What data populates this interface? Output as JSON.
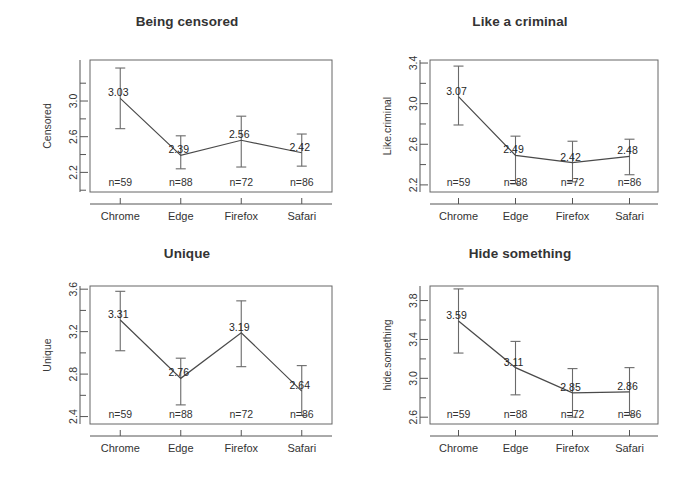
{
  "figure": {
    "background": "#ffffff",
    "line_color": "#4a4a4a",
    "errorbar_color": "#6a6a6a",
    "box_color": "#666666",
    "text_color": "#333333"
  },
  "chart_data": [
    {
      "type": "line",
      "title": "Being censored",
      "xlabel": "",
      "ylabel": "Censored",
      "categories": [
        "Chrome",
        "Edge",
        "Firefox",
        "Safari"
      ],
      "values": [
        3.03,
        2.39,
        2.56,
        2.42
      ],
      "value_labels": [
        "3.03",
        "2.39",
        "2.56",
        "2.42"
      ],
      "error_low": [
        2.69,
        2.24,
        2.26,
        2.27
      ],
      "error_high": [
        3.37,
        2.61,
        2.83,
        2.63
      ],
      "n_labels": [
        "n=59",
        "n=88",
        "n=72",
        "n=86"
      ],
      "n_values": [
        59,
        88,
        72,
        86
      ],
      "yticks": [
        2.2,
        2.6,
        3.0
      ],
      "ytick_labels": [
        "2.2",
        "2.6",
        "3.0"
      ],
      "yminor": [
        2.0,
        2.4,
        2.8,
        3.2
      ],
      "ylim": [
        1.98,
        3.46
      ],
      "grid": false,
      "legend": "none"
    },
    {
      "type": "line",
      "title": "Like a criminal",
      "xlabel": "",
      "ylabel": "Like.criminal",
      "categories": [
        "Chrome",
        "Edge",
        "Firefox",
        "Safari"
      ],
      "values": [
        3.07,
        2.49,
        2.42,
        2.48
      ],
      "value_labels": [
        "3.07",
        "2.49",
        "2.42",
        "2.48"
      ],
      "error_low": [
        2.79,
        2.21,
        2.23,
        2.3
      ],
      "error_high": [
        3.37,
        2.68,
        2.63,
        2.65
      ],
      "n_labels": [
        "n=59",
        "n=88",
        "n=72",
        "n=86"
      ],
      "n_values": [
        59,
        88,
        72,
        86
      ],
      "yticks": [
        2.2,
        2.6,
        3.0,
        3.4
      ],
      "ytick_labels": [
        "2.2",
        "2.6",
        "3.0",
        "3.4"
      ],
      "yminor": [
        2.4,
        2.8,
        3.2
      ],
      "ylim": [
        2.13,
        3.43
      ],
      "grid": false,
      "legend": "none"
    },
    {
      "type": "line",
      "title": "Unique",
      "xlabel": "",
      "ylabel": "Unique",
      "categories": [
        "Chrome",
        "Edge",
        "Firefox",
        "Safari"
      ],
      "values": [
        3.31,
        2.76,
        3.19,
        2.64
      ],
      "value_labels": [
        "3.31",
        "2.76",
        "3.19",
        "2.64"
      ],
      "error_low": [
        3.02,
        2.51,
        2.87,
        2.41
      ],
      "error_high": [
        3.58,
        2.95,
        3.49,
        2.88
      ],
      "n_labels": [
        "n=59",
        "n=88",
        "n=72",
        "n=86"
      ],
      "n_values": [
        59,
        88,
        72,
        86
      ],
      "yticks": [
        2.4,
        2.8,
        3.2,
        3.6
      ],
      "ytick_labels": [
        "2.4",
        "2.8",
        "3.2",
        "3.6"
      ],
      "yminor": [
        2.6,
        3.0,
        3.4
      ],
      "ylim": [
        2.33,
        3.63
      ],
      "grid": false,
      "legend": "none"
    },
    {
      "type": "line",
      "title": "Hide something",
      "xlabel": "",
      "ylabel": "hide.something",
      "categories": [
        "Chrome",
        "Edge",
        "Firefox",
        "Safari"
      ],
      "values": [
        3.59,
        3.11,
        2.85,
        2.86
      ],
      "value_labels": [
        "3.59",
        "3.11",
        "2.85",
        "2.86"
      ],
      "error_low": [
        3.26,
        2.83,
        2.6,
        2.62
      ],
      "error_high": [
        3.92,
        3.38,
        3.1,
        3.11
      ],
      "n_labels": [
        "n=59",
        "n=88",
        "n=72",
        "n=86"
      ],
      "n_values": [
        59,
        88,
        72,
        86
      ],
      "yticks": [
        2.6,
        3.0,
        3.4,
        3.8
      ],
      "ytick_labels": [
        "2.6",
        "3.0",
        "3.4",
        "3.8"
      ],
      "yminor": [
        2.8,
        3.2,
        3.6
      ],
      "ylim": [
        2.53,
        3.95
      ],
      "grid": false,
      "legend": "none"
    }
  ]
}
